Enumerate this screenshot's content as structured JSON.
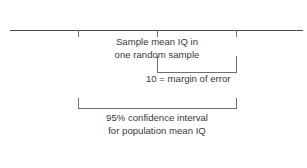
{
  "figure": {
    "type": "statistics-confidence-interval-diagram",
    "crop_remnant_text": "",
    "axis": {
      "name": "number-line",
      "ticks": [
        {
          "id": "lower-bound",
          "x": 78
        },
        {
          "id": "sample-mean",
          "x": 157
        },
        {
          "id": "upper-bound",
          "x": 236
        }
      ]
    },
    "sample_mean_label": {
      "line1": "Sample mean IQ in",
      "line2": "one random sample"
    },
    "margin_of_error": {
      "label": "10 = margin of error",
      "value": 10
    },
    "confidence_interval": {
      "line1": "95% confidence interval",
      "line2": "for population mean IQ",
      "level": "95%"
    },
    "colors": {
      "axis": "#4a4a4a",
      "bracket": "#6e6e6e",
      "text": "#3a3a3a",
      "background": "#ffffff"
    }
  }
}
